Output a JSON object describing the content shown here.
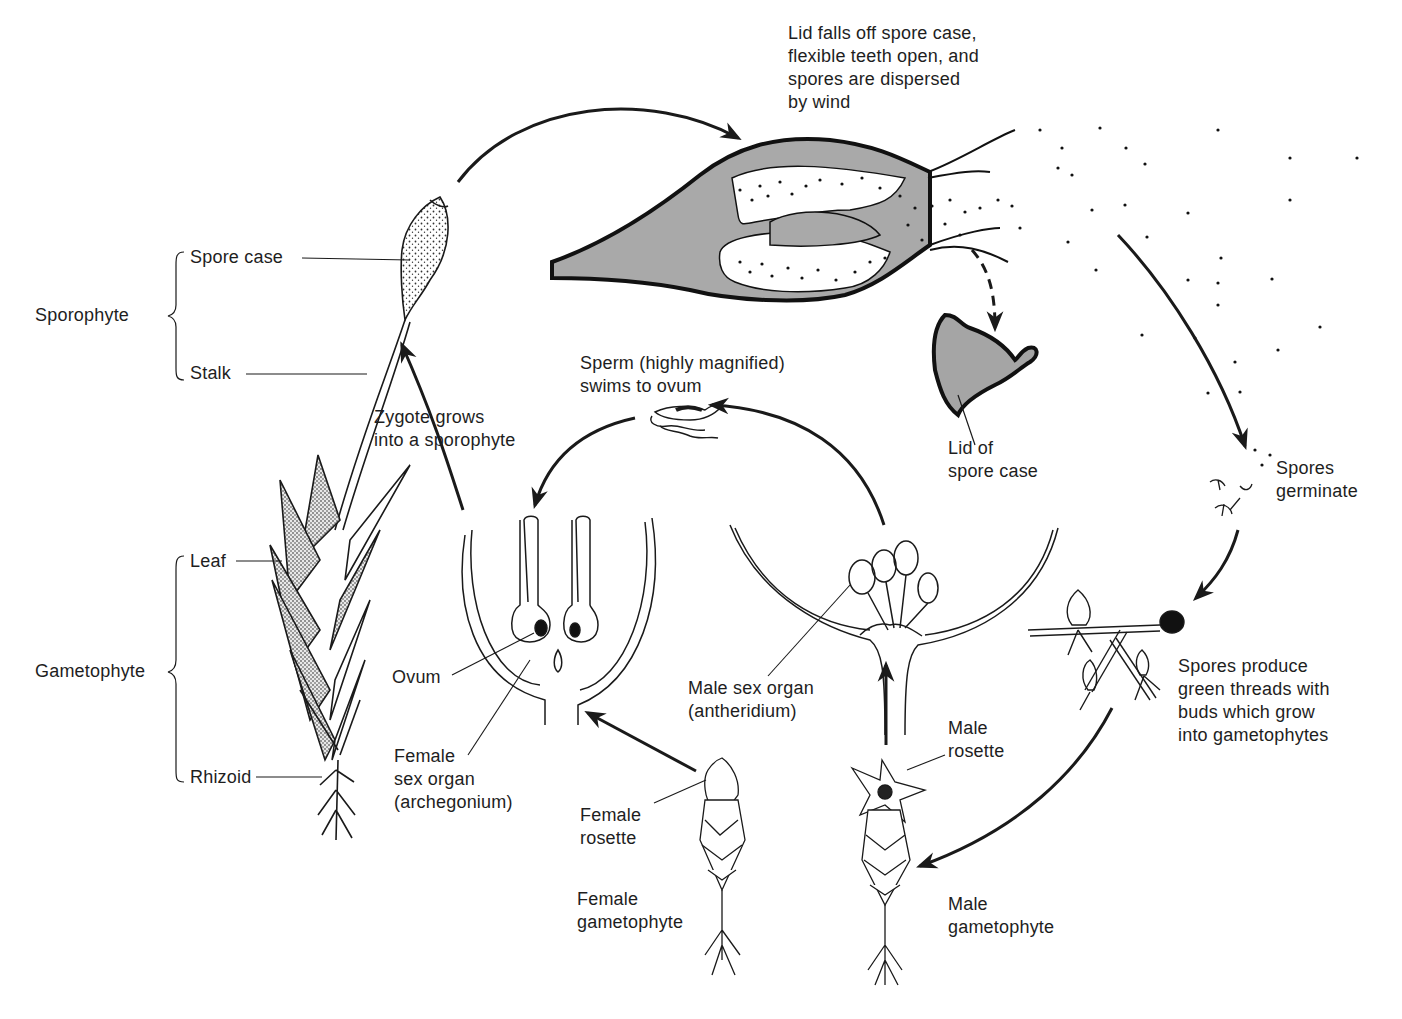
{
  "colors": {
    "ink": "#1a1a1a",
    "capsule_fill": "#a9a9a9",
    "lid_fill": "#a5a5a5",
    "background": "#ffffff"
  },
  "labels": {
    "dispersal": [
      "Lid falls off spore case,",
      "flexible teeth open, and",
      "spores are dispersed",
      "by wind"
    ],
    "sporophyte": "Sporophyte",
    "spore_case": "Spore case",
    "stalk": "Stalk",
    "gametophyte": "Gametophyte",
    "leaf": "Leaf",
    "rhizoid": "Rhizoid",
    "zygote": [
      "Zygote grows",
      "into a sporophyte"
    ],
    "sperm": [
      "Sperm (highly magnified)",
      "swims to ovum"
    ],
    "lid": [
      "Lid of",
      "spore case"
    ],
    "spores_germinate": [
      "Spores",
      "germinate"
    ],
    "ovum": "Ovum",
    "female_sex_organ": [
      "Female",
      "sex organ",
      "(archegonium)"
    ],
    "male_sex_organ": [
      "Male sex organ",
      "(antheridium)"
    ],
    "male_rosette": [
      "Male",
      "rosette"
    ],
    "female_rosette": [
      "Female",
      "rosette"
    ],
    "female_gametophyte": [
      "Female",
      "gametophyte"
    ],
    "male_gametophyte": [
      "Male",
      "gametophyte"
    ],
    "spores_produce": [
      "Spores produce",
      "green threads with",
      "buds which grow",
      "into gametophytes"
    ]
  },
  "stages": [
    "Mature sporophyte on gametophyte",
    "Spore case opens, spores dispersed by wind",
    "Spores germinate",
    "Protonema with buds grows into gametophytes",
    "Male and female gametophytes with rosettes",
    "Antheridium releases sperm",
    "Sperm swims to ovum in archegonium",
    "Zygote grows into sporophyte"
  ]
}
